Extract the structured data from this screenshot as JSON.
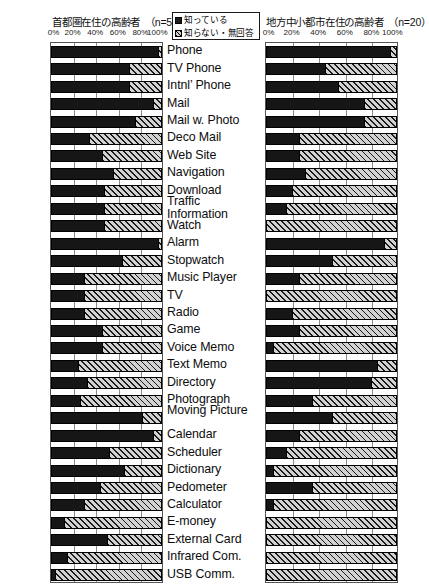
{
  "header": {
    "left_title": "首都圏在住の高齢者　（n=50）",
    "right_title": "地方中小都市在住の高齢者　（n=20）",
    "legend": {
      "known_label": "知っている",
      "unknown_label": "知らない・無回答",
      "known_swatch": "filled-square-icon",
      "unknown_swatch": "hatched-square-icon"
    }
  },
  "axis": {
    "ticks": [
      "0%",
      "20%",
      "40%",
      "60%",
      "80%",
      "100%"
    ]
  },
  "colors": {
    "known": "#161616",
    "unknown_fill": "#d2d2d2",
    "unknown_hatch": "#1a1a1a",
    "grid": "#8a8a8a",
    "plot_border": "#555555",
    "text": "#0d0d0d",
    "page_background": "#ffffff"
  },
  "chart_data": {
    "type": "bar",
    "orientation": "horizontal",
    "stacked": true,
    "normalized": true,
    "xlabel": "",
    "ylabel": "",
    "xlim": [
      0,
      100
    ],
    "xticks": [
      0,
      20,
      40,
      60,
      80,
      100
    ],
    "grid": true,
    "legend_position": "top-center",
    "legend_entries": [
      "知っている",
      "知らない・無回答"
    ],
    "panels": [
      {
        "name": "首都圏在住の高齢者（n=50）",
        "n": 50,
        "position": "left",
        "series": [
          {
            "name": "知っている",
            "values": [
              96,
              70,
              70,
              92,
              76,
              34,
              46,
              56,
              48,
              48,
              48,
              96,
              64,
              30,
              30,
              30,
              46,
              46,
              24,
              32,
              26,
              82,
              92,
              52,
              66,
              44,
              30,
              12,
              50,
              14,
              4,
              2,
              0
            ]
          },
          {
            "name": "知らない・無回答",
            "values": [
              4,
              30,
              30,
              8,
              24,
              66,
              54,
              44,
              52,
              52,
              52,
              4,
              36,
              70,
              70,
              70,
              54,
              54,
              76,
              68,
              74,
              18,
              8,
              48,
              34,
              56,
              70,
              88,
              50,
              86,
              96,
              98,
              100
            ]
          }
        ]
      },
      {
        "name": "地方中小都市在住の高齢者（n=20）",
        "n": 20,
        "position": "right",
        "series": [
          {
            "name": "知っている",
            "values": [
              95,
              45,
              55,
              75,
              75,
              25,
              25,
              30,
              20,
              15,
              0,
              90,
              50,
              25,
              0,
              20,
              25,
              5,
              85,
              80,
              35,
              50,
              25,
              15,
              5,
              35,
              5,
              0,
              0,
              0,
              0,
              0,
              0
            ]
          },
          {
            "name": "知らない・無回答",
            "values": [
              5,
              55,
              45,
              25,
              25,
              75,
              75,
              70,
              80,
              85,
              100,
              10,
              50,
              75,
              100,
              80,
              75,
              95,
              15,
              20,
              65,
              50,
              75,
              85,
              95,
              65,
              95,
              100,
              100,
              100,
              100,
              100,
              100
            ]
          }
        ]
      }
    ],
    "categories": [
      "Phone",
      "TV Phone",
      "Intnl’ Phone",
      "Mail",
      "Mail w. Photo",
      "Deco Mail",
      "Web Site",
      "Navigation",
      "Download",
      "Traffic Information",
      "Watch",
      "Alarm",
      "Stopwatch",
      "Music Player",
      "TV",
      "Radio",
      "Game",
      "Voice Memo",
      "Text Memo",
      "Directory",
      "Photograph",
      "Moving Picture",
      "Calendar",
      "Scheduler",
      "Dictionary",
      "Pedometer",
      "Calculator",
      "E-money",
      "External Card",
      "Infrared Com.",
      "USB Comm."
    ]
  }
}
